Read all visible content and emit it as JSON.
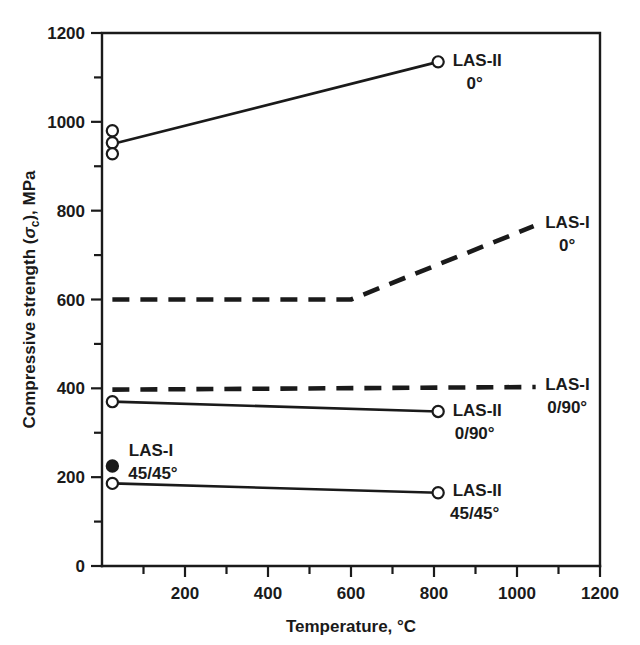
{
  "chart_data": {
    "type": "line",
    "title": "",
    "xlabel": "Temperature, °C",
    "ylabel": "Compressive strength (σc), MPa",
    "ylabel_parts": {
      "pre": "Compressive strength (",
      "sym": "σ",
      "sub": "c",
      "post": "), MPa"
    },
    "xlim": [
      0,
      1200
    ],
    "ylim": [
      0,
      1200
    ],
    "x_ticks": [
      0,
      200,
      400,
      600,
      800,
      1000,
      1200
    ],
    "x_tick_labels": [
      "",
      "200",
      "400",
      "600",
      "800",
      "1000",
      "1200"
    ],
    "x_minor_ticks": [
      100,
      300,
      500,
      700,
      900,
      1100
    ],
    "y_ticks": [
      0,
      200,
      400,
      600,
      800,
      1000,
      1200
    ],
    "y_tick_labels": [
      "0",
      "200",
      "400",
      "600",
      "800",
      "1000",
      "1200"
    ],
    "y_minor_ticks": [
      100,
      300,
      500,
      700,
      900,
      1100
    ],
    "grid": false,
    "legend_position": "inline-right-of-line-ends",
    "series": [
      {
        "name": "LAS-II 0°",
        "label_line1": "LAS-II",
        "label_line2": "0°",
        "style": "solid",
        "x": [
          25,
          810
        ],
        "y": [
          950,
          1135
        ],
        "markers": [
          {
            "x": 25,
            "y": 980,
            "fill": "open"
          },
          {
            "x": 25,
            "y": 953,
            "fill": "open"
          },
          {
            "x": 25,
            "y": 928,
            "fill": "open"
          },
          {
            "x": 810,
            "y": 1135,
            "fill": "open"
          }
        ],
        "label_x": 845,
        "label_y": 1140
      },
      {
        "name": "LAS-I 0°",
        "label_line1": "LAS-I",
        "label_line2": "0°",
        "style": "dashed",
        "x": [
          25,
          600,
          1040
        ],
        "y": [
          600,
          600,
          765
        ],
        "markers": [],
        "label_x": 1068,
        "label_y": 775
      },
      {
        "name": "LAS-I 0/90°",
        "label_line1": "LAS-I",
        "label_line2": "0/90°",
        "style": "dashed",
        "x": [
          25,
          1045
        ],
        "y": [
          397,
          403
        ],
        "markers": [],
        "label_x": 1068,
        "label_y": 410
      },
      {
        "name": "LAS-II 0/90°",
        "label_line1": "LAS-II",
        "label_line2": "0/90°",
        "style": "solid",
        "x": [
          25,
          810
        ],
        "y": [
          370,
          348
        ],
        "markers": [
          {
            "x": 25,
            "y": 370,
            "fill": "open"
          },
          {
            "x": 810,
            "y": 348,
            "fill": "open"
          }
        ],
        "label_x": 845,
        "label_y": 352
      },
      {
        "name": "LAS-II 45/45°",
        "label_line1": "LAS-II",
        "label_line2": "45/45°",
        "style": "solid",
        "x": [
          25,
          810
        ],
        "y": [
          186,
          165
        ],
        "markers": [
          {
            "x": 25,
            "y": 186,
            "fill": "open"
          },
          {
            "x": 810,
            "y": 165,
            "fill": "open"
          }
        ],
        "label_x": 845,
        "label_y": 172
      }
    ],
    "points": [
      {
        "name": "LAS-I 45/45°",
        "label_line1": "LAS-I",
        "label_line2": "45/45°",
        "x": 25,
        "y": 225,
        "fill": "filled",
        "label_x": 118,
        "label_y": 262
      }
    ]
  }
}
